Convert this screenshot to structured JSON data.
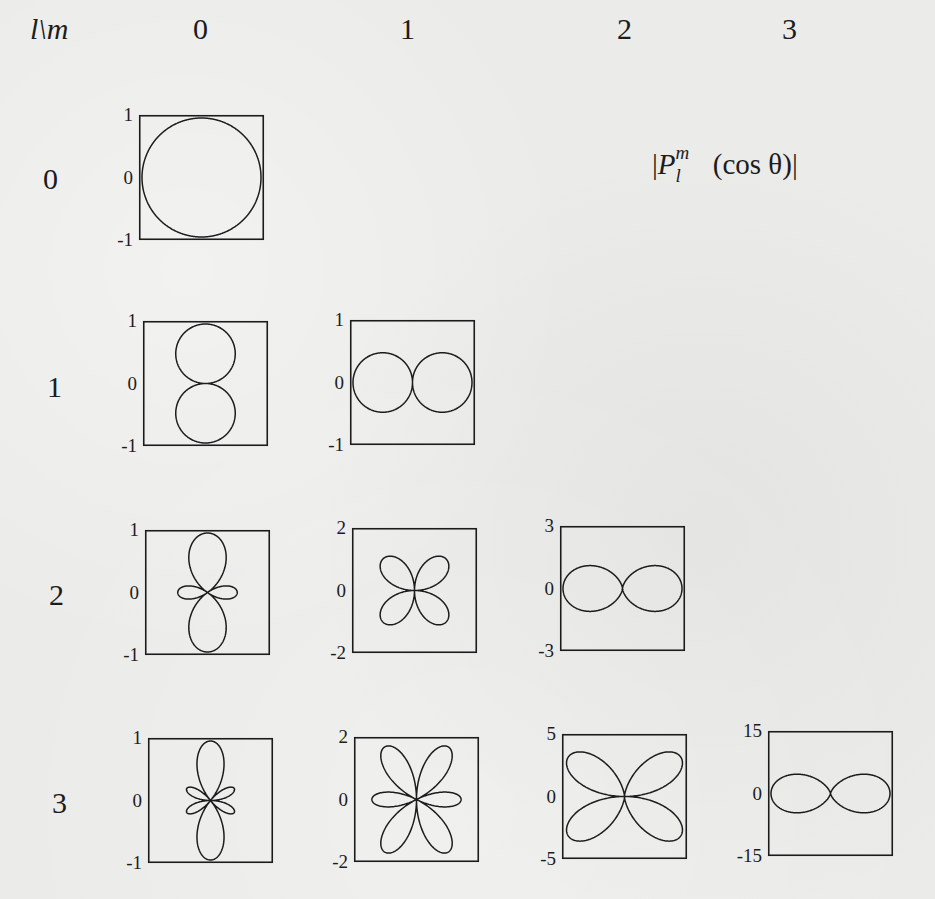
{
  "chart_data": {
    "type": "polar-grid",
    "corner_label": "l\\m",
    "column_labels": [
      "0",
      "1",
      "2",
      "3"
    ],
    "row_labels": [
      "0",
      "1",
      "2",
      "3"
    ],
    "plots": [
      {
        "l": 0,
        "m": 0,
        "range": 1,
        "ticks": [
          "1",
          "0",
          "-1"
        ],
        "function": "1",
        "shape": "circle"
      },
      {
        "l": 1,
        "m": 0,
        "range": 1,
        "ticks": [
          "1",
          "0",
          "-1"
        ],
        "function": "|cosθ|",
        "shape": "vertical two-lobe"
      },
      {
        "l": 1,
        "m": 1,
        "range": 1,
        "ticks": [
          "1",
          "0",
          "-1"
        ],
        "function": "|sinθ|",
        "shape": "horizontal two-lobe"
      },
      {
        "l": 2,
        "m": 0,
        "range": 1,
        "ticks": [
          "1",
          "0",
          "-1"
        ],
        "function": "|(3cos²θ-1)/2|",
        "shape": "vertical lobes with small equatorial lobes"
      },
      {
        "l": 2,
        "m": 1,
        "range": 2,
        "ticks": [
          "2",
          "0",
          "-2"
        ],
        "function": "|3cosθ sinθ|",
        "shape": "four-leaf (diagonal)"
      },
      {
        "l": 2,
        "m": 2,
        "range": 3,
        "ticks": [
          "3",
          "0",
          "-3"
        ],
        "function": "|3sin²θ|",
        "shape": "horizontal figure-eight"
      },
      {
        "l": 3,
        "m": 0,
        "range": 1,
        "ticks": [
          "1",
          "0",
          "-1"
        ],
        "function": "|(5cos³θ-3cosθ)/2|",
        "shape": "vertical lobes with four small side lobes"
      },
      {
        "l": 3,
        "m": 1,
        "range": 2,
        "ticks": [
          "2",
          "0",
          "-2"
        ],
        "function": "|(3/2)sinθ(5cos²θ-1)|",
        "shape": "six-petal"
      },
      {
        "l": 3,
        "m": 2,
        "range": 5,
        "ticks": [
          "5",
          "0",
          "-5"
        ],
        "function": "|15cosθ sin²θ|",
        "shape": "four-leaf (near horizontal)"
      },
      {
        "l": 3,
        "m": 3,
        "range": 15,
        "ticks": [
          "15",
          "0",
          "-15"
        ],
        "function": "|15sin³θ|",
        "shape": "horizontal figure-eight"
      }
    ],
    "xlabel": "",
    "ylabel": "",
    "grid": false
  },
  "header": {
    "corner": "l\\m",
    "cols": [
      "0",
      "1",
      "2",
      "3"
    ]
  },
  "rows": [
    "0",
    "1",
    "2",
    "3"
  ],
  "formula": {
    "open": "|",
    "P": "P",
    "sup": "m",
    "sub": "l",
    "arg": "(cos θ)",
    "close": "|"
  },
  "colors": {
    "ink": "#1c1c1c",
    "paper": "#ebebe9"
  }
}
